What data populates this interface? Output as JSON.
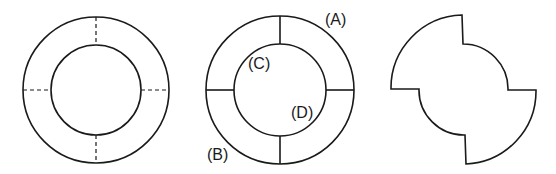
{
  "figures": [
    {
      "id": "ring-dashed",
      "description": "Annulus with four dashed radial division lines"
    },
    {
      "id": "ring-labeled",
      "description": "Annulus with four solid radial division lines and labels",
      "labels": {
        "a": "(A)",
        "b": "(B)",
        "c": "(C)",
        "d": "(D)"
      }
    },
    {
      "id": "pinwheel-shape",
      "description": "Shape formed by alternating outer and inner arcs joined by radial segments"
    }
  ],
  "colors": {
    "stroke": "#1a1a1a",
    "background": "#ffffff"
  }
}
